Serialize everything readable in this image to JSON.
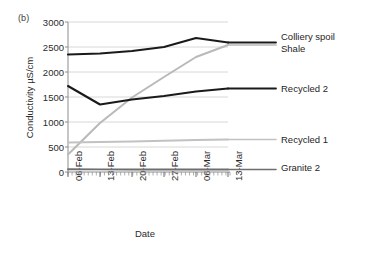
{
  "figure": {
    "panel_label": "(b)"
  },
  "chart_data": {
    "type": "line",
    "title": "",
    "panel": "(b)",
    "xlabel": "Date",
    "ylabel": "Conductivity µS/cm",
    "categories": [
      "06-Feb",
      "13-Feb",
      "20-Feb",
      "27-Feb",
      "06-Mar",
      "13-Mar"
    ],
    "x": [
      "06-Feb",
      "13-Feb",
      "20-Feb",
      "27-Feb",
      "06-Mar",
      "13-Mar"
    ],
    "ylim": [
      0,
      3000
    ],
    "yticks": [
      0,
      500,
      1000,
      1500,
      2000,
      2500,
      3000
    ],
    "ytick_labels": [
      "0",
      "500",
      "1000",
      "1500",
      "2000",
      "2500",
      "3000"
    ],
    "grid": "horizontal",
    "legend_position": "right",
    "series": [
      {
        "name": "Colliery spoil",
        "color": "#1a1a1a",
        "width": 2.1,
        "values": [
          2350,
          2370,
          2420,
          2500,
          2680,
          2590
        ]
      },
      {
        "name": "Shale",
        "color": "#b9b9b9",
        "width": 2.0,
        "values": [
          350,
          980,
          1490,
          1900,
          2300,
          2540
        ]
      },
      {
        "name": "Recycled 2",
        "color": "#1a1a1a",
        "width": 2.1,
        "values": [
          1720,
          1350,
          1450,
          1520,
          1610,
          1670
        ]
      },
      {
        "name": "Recycled 1",
        "color": "#c2c2c2",
        "width": 1.9,
        "values": [
          590,
          600,
          610,
          625,
          640,
          650
        ]
      },
      {
        "name": "Granite 2",
        "color": "#6e6e6e",
        "width": 1.9,
        "values": [
          55,
          52,
          50,
          50,
          50,
          50
        ]
      }
    ],
    "legend_entries": [
      {
        "label": "Colliery spoil"
      },
      {
        "label": "Shale"
      },
      {
        "label": "Recycled 2"
      },
      {
        "label": "Recycled 1"
      },
      {
        "label": "Granite 2"
      }
    ]
  }
}
